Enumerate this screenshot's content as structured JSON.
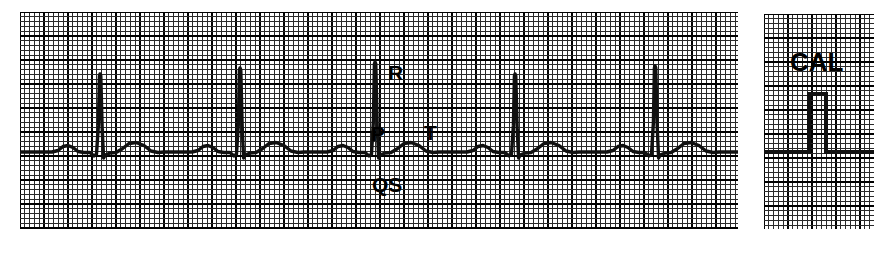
{
  "figure": {
    "name": "ecg-rhythm-strip",
    "background_color": "#ffffff",
    "ink_color": "#101010"
  },
  "grid": {
    "fine_spacing_px": 4.8,
    "bold_every": 5,
    "fine_color": "#2a2a2a",
    "bold_color": "#000000",
    "fine_width_px": 1,
    "bold_width_px": 2
  },
  "rhythm_strip": {
    "panel_name": "rhythm-strip-panel",
    "width_px": 718,
    "height_px": 217,
    "baseline_y_px": 140,
    "beats": [
      {
        "name": "beat-1",
        "r_peak_x_px": 80,
        "r_height_px": 76,
        "p_present": true,
        "t_present": true
      },
      {
        "name": "beat-2",
        "r_peak_x_px": 220,
        "r_height_px": 82,
        "p_present": true,
        "t_present": true
      },
      {
        "name": "beat-3",
        "r_peak_x_px": 355,
        "r_height_px": 88,
        "p_present": true,
        "t_present": true
      },
      {
        "name": "beat-4",
        "r_peak_x_px": 495,
        "r_height_px": 76,
        "p_present": true,
        "t_present": true
      },
      {
        "name": "beat-5",
        "r_peak_x_px": 635,
        "r_height_px": 84,
        "p_present": true,
        "t_present": true
      }
    ],
    "labels": [
      {
        "name": "label-r",
        "text": "R",
        "wave": "R wave"
      },
      {
        "name": "label-p",
        "text": "P",
        "wave": "P wave"
      },
      {
        "name": "label-t",
        "text": "T",
        "wave": "T wave"
      },
      {
        "name": "label-qs",
        "text": "QS",
        "wave": "QS complex"
      }
    ]
  },
  "calibration": {
    "panel_name": "calibration-panel",
    "width_px": 110,
    "height_px": 215,
    "label": "CAL",
    "baseline_y_px": 138,
    "pulse_start_x_px": 45,
    "pulse_end_x_px": 62,
    "pulse_height_px": 58
  }
}
